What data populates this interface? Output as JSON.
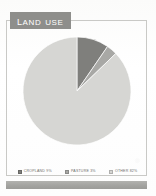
{
  "panel": {
    "title": "Land Use",
    "title_banner_color": "#8e8e8b",
    "frame_color": "#c9c9c6",
    "footer_bar_color": "#a3a3a0",
    "background_color": "#fdfdfc"
  },
  "legend": {
    "position": "bottom",
    "items": [
      {
        "label": "Cropland 9%",
        "color": "#7f7f7c"
      },
      {
        "label": "Pasture 3%",
        "color": "#a8a8a5"
      },
      {
        "label": "Other 82%",
        "color": "#d6d6d3"
      }
    ]
  },
  "chart_data": {
    "type": "pie",
    "title": "Land Use",
    "subtitle": "",
    "xlabel": "",
    "ylabel": "",
    "categories": [
      "Cropland",
      "Pasture",
      "Other"
    ],
    "values": [
      9,
      3,
      82
    ],
    "value_unit": "%",
    "data_labels": [
      "Cropland 9%",
      "Pasture 3%",
      "Other 82%"
    ],
    "colors": [
      "#7f7f7c",
      "#a8a8a5",
      "#d6d6d3"
    ],
    "legend": "bottom",
    "grid": false,
    "start_angle_deg": 0,
    "direction": "clockwise"
  }
}
